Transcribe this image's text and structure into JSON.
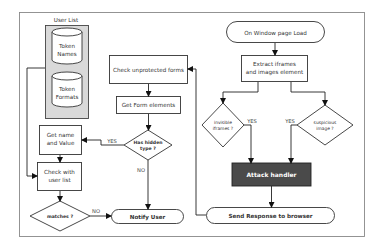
{
  "diagram": {
    "user_list_label": "User List",
    "token_names": [
      "Token",
      "Names"
    ],
    "token_formats": [
      "Token",
      "Formats"
    ],
    "check_unprotected_forms": "Check unprotected forms",
    "get_form_elements": "Get Form elements",
    "has_hidden_type": [
      "Has hidden",
      "type ?"
    ],
    "get_name_and_value": [
      "Get name",
      "and Value"
    ],
    "check_with_user_list": [
      "Check with",
      "user list"
    ],
    "matches": "matches ?",
    "notify_user": "Notify User",
    "on_window_page_load": "On Window page Load",
    "extract_iframes": [
      "Extract iframes",
      "and images element"
    ],
    "invisible_iframes": [
      "invisible",
      "iframes ?"
    ],
    "suspicious_image": [
      "suspicious",
      "image ?"
    ],
    "attack_handler": "Attack handler",
    "send_response": "Send Response to browser",
    "labels": {
      "yes_hidden": "YES",
      "no_hidden": "NO",
      "no_matches": "NO",
      "yes_iframes": "YES",
      "yes_image": "YES"
    },
    "colors": {
      "attack_handler_fill": "#4a4a4a",
      "database_group_fill": "#d9d9d9",
      "frame_stroke": "#888888"
    }
  }
}
